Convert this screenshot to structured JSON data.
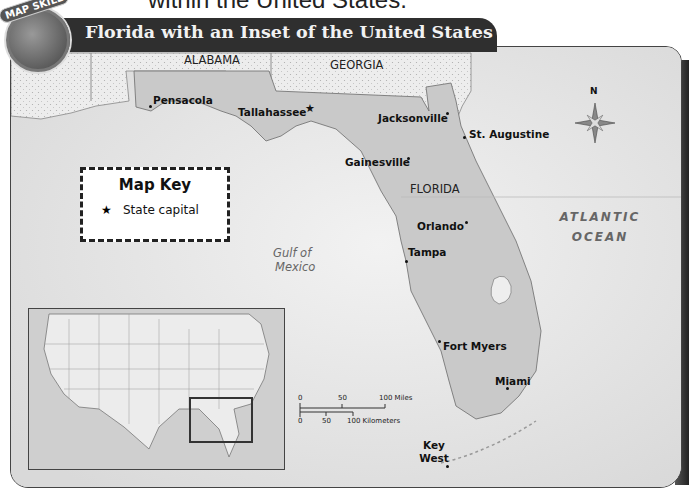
{
  "page": {
    "caption_fragment": "within the United States.",
    "badge_label": "MAP SKILL",
    "title": "Florida with an Inset of the United States"
  },
  "map": {
    "states": [
      "ALABAMA",
      "GEORGIA",
      "FLORIDA"
    ],
    "water_bodies": {
      "gulf": "Gulf of\nMexico",
      "gulf_line1": "Gulf of",
      "gulf_line2": "Mexico",
      "ocean_line1": "ATLANTIC",
      "ocean_line2": "OCEAN"
    },
    "cities": [
      {
        "name": "Pensacola",
        "type": "city"
      },
      {
        "name": "Tallahassee",
        "type": "capital"
      },
      {
        "name": "Jacksonville",
        "type": "city"
      },
      {
        "name": "St. Augustine",
        "type": "city"
      },
      {
        "name": "Gainesville",
        "type": "city"
      },
      {
        "name": "Orlando",
        "type": "city"
      },
      {
        "name": "Tampa",
        "type": "city"
      },
      {
        "name": "Fort Myers",
        "type": "city"
      },
      {
        "name": "Miami",
        "type": "city"
      },
      {
        "name": "Key West",
        "type": "city"
      }
    ],
    "compass_label": "N",
    "map_key": {
      "title": "Map Key",
      "items": [
        {
          "symbol": "★",
          "label": "State capital"
        }
      ]
    },
    "scale": {
      "miles_ticks": [
        "0",
        "50",
        "100 Miles"
      ],
      "km_ticks": [
        "0",
        "50",
        "100 Kilometers"
      ]
    },
    "inset": {
      "description": "United States inset with Florida highlighted"
    }
  }
}
